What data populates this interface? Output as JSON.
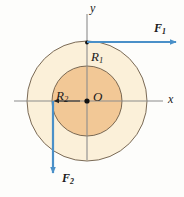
{
  "figure": {
    "background_color": "#fdfdfb",
    "labels": {
      "radius_outer": "R",
      "radius_outer_sub": "1",
      "radius_inner": "R",
      "radius_inner_sub": "2",
      "origin": "O",
      "axis_x": "x",
      "axis_y": "y",
      "force_1": "F",
      "force_1_sub": "1",
      "force_2": "F",
      "force_2_sub": "2"
    },
    "colors": {
      "outer_disk_fill": "#fbf0d9",
      "inner_disk_fill": "#f2c896",
      "disk_stroke": "#6b5a46",
      "axis_stroke": "#8c8c8c",
      "force_arrow": "#4a90c8",
      "text": "#1a1a1a"
    },
    "geometry": {
      "center_x": 87,
      "center_y": 101,
      "outer_radius": 60,
      "inner_radius": 35,
      "axis_x_start": 14,
      "axis_x_end": 165,
      "axis_y_start": 14,
      "axis_y_end": 162
    },
    "forces": {
      "f1": {
        "direction": "right",
        "tail_x": 87,
        "tail_y": 42,
        "head_x": 179,
        "head_y": 42,
        "applied_at": "top of outer disk"
      },
      "f2": {
        "direction": "down",
        "tail_x": 53,
        "tail_y": 101,
        "head_x": 53,
        "head_y": 178,
        "applied_at": "left of inner disk"
      }
    }
  }
}
